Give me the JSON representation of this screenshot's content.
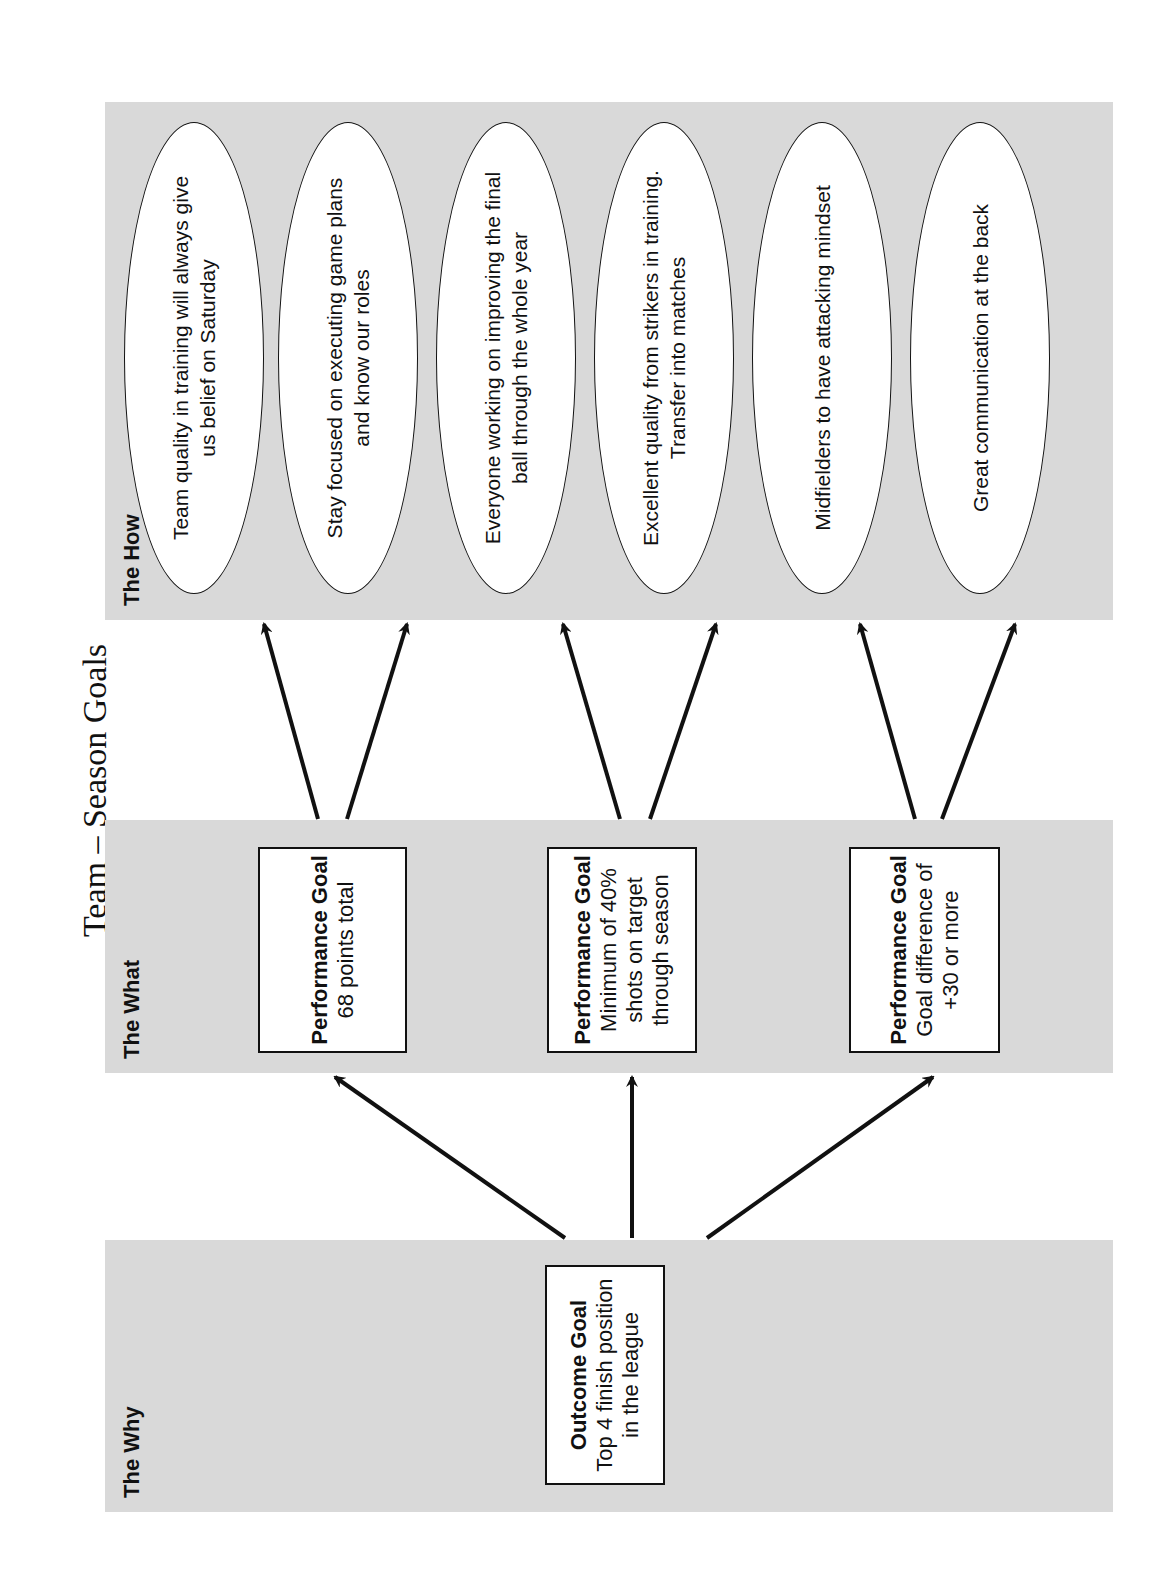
{
  "title": "Team – Season Goals",
  "panels": {
    "why": {
      "label": "The Why"
    },
    "what": {
      "label": "The What"
    },
    "how": {
      "label": "The How"
    }
  },
  "outcome_goal": {
    "heading": "Outcome Goal",
    "text": "Top 4 finish position in the league"
  },
  "performance_goals": [
    {
      "heading": "Performance Goal",
      "text": "68 points total"
    },
    {
      "heading": "Performance Goal",
      "text": "Minimum of 40% shots on target through season"
    },
    {
      "heading": "Performance Goal",
      "text": "Goal difference of +30 or more"
    }
  ],
  "hows": [
    {
      "text": "Team quality in training will always give us belief on Saturday",
      "parent": 0
    },
    {
      "text": "Stay focused on executing game plans and know our roles",
      "parent": 0
    },
    {
      "text": "Everyone working on improving the final ball through the whole year",
      "parent": 1
    },
    {
      "text": "Excellent quality from strikers in training. Transfer into matches",
      "parent": 1
    },
    {
      "text": "Midfielders to have attacking mindset",
      "parent": 2
    },
    {
      "text": "Great communication at the back",
      "parent": 2
    }
  ],
  "colors": {
    "panel_bg": "#d9d9d9",
    "box_bg": "#ffffff",
    "stroke": "#111111"
  }
}
